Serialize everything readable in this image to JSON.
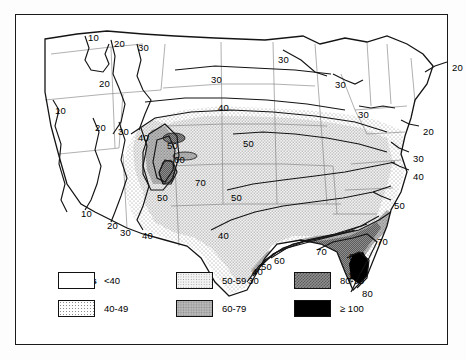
{
  "figure": {
    "type": "choropleth-contour-map",
    "region": "Contiguous United States",
    "quantity": "Days"
  },
  "legend": {
    "title": "Days",
    "entries": [
      {
        "label": "<40",
        "pattern": "white",
        "col": 0,
        "row": 0
      },
      {
        "label": "40-49",
        "pattern": "fine-stipple",
        "col": 0,
        "row": 1
      },
      {
        "label": "50-59",
        "pattern": "light-gray",
        "col": 1,
        "row": 0
      },
      {
        "label": "60-79",
        "pattern": "mid-gray",
        "col": 1,
        "row": 1
      },
      {
        "label": "80-99",
        "pattern": "dark-check",
        "col": 2,
        "row": 0
      },
      {
        "label": "≥ 100",
        "pattern": "black",
        "col": 2,
        "row": 1
      }
    ]
  },
  "contour_labels": [
    {
      "text": "10",
      "x": 73,
      "y": 18
    },
    {
      "text": "20",
      "x": 99,
      "y": 24
    },
    {
      "text": "30",
      "x": 123,
      "y": 28
    },
    {
      "text": "20",
      "x": 84,
      "y": 64
    },
    {
      "text": "10",
      "x": 40,
      "y": 91
    },
    {
      "text": "20",
      "x": 80,
      "y": 108
    },
    {
      "text": "30",
      "x": 103,
      "y": 112
    },
    {
      "text": "40",
      "x": 123,
      "y": 118
    },
    {
      "text": "30",
      "x": 196,
      "y": 60
    },
    {
      "text": "40",
      "x": 203,
      "y": 88
    },
    {
      "text": "50",
      "x": 152,
      "y": 126
    },
    {
      "text": "60",
      "x": 159,
      "y": 140
    },
    {
      "text": "70",
      "x": 180,
      "y": 163
    },
    {
      "text": "50",
      "x": 142,
      "y": 178
    },
    {
      "text": "50",
      "x": 228,
      "y": 124
    },
    {
      "text": "50",
      "x": 216,
      "y": 178
    },
    {
      "text": "30",
      "x": 263,
      "y": 40
    },
    {
      "text": "30",
      "x": 320,
      "y": 65
    },
    {
      "text": "30",
      "x": 343,
      "y": 95
    },
    {
      "text": "20",
      "x": 437,
      "y": 48
    },
    {
      "text": "20",
      "x": 408,
      "y": 112
    },
    {
      "text": "30",
      "x": 398,
      "y": 139
    },
    {
      "text": "40",
      "x": 398,
      "y": 157
    },
    {
      "text": "50",
      "x": 379,
      "y": 186
    },
    {
      "text": "10",
      "x": 66,
      "y": 194
    },
    {
      "text": "20",
      "x": 92,
      "y": 206
    },
    {
      "text": "30",
      "x": 105,
      "y": 213
    },
    {
      "text": "40",
      "x": 127,
      "y": 216
    },
    {
      "text": "40",
      "x": 203,
      "y": 216
    },
    {
      "text": "30",
      "x": 233,
      "y": 261
    },
    {
      "text": "40",
      "x": 237,
      "y": 252
    },
    {
      "text": "50",
      "x": 246,
      "y": 247
    },
    {
      "text": "60",
      "x": 259,
      "y": 241
    },
    {
      "text": "70",
      "x": 301,
      "y": 232
    },
    {
      "text": "70",
      "x": 362,
      "y": 222
    },
    {
      "text": "80",
      "x": 334,
      "y": 237
    },
    {
      "text": "100",
      "x": 333,
      "y": 256
    },
    {
      "text": "80",
      "x": 347,
      "y": 274
    }
  ],
  "colors": {
    "white": "#ffffff",
    "fine_stipple": "#e8e8e8",
    "light_gray": "#d4d4d4",
    "mid_gray": "#a8a8a8",
    "dark_check": "#767676",
    "black": "#000000",
    "line": "#1a1a1a",
    "state_line": "#6b6b6b"
  }
}
